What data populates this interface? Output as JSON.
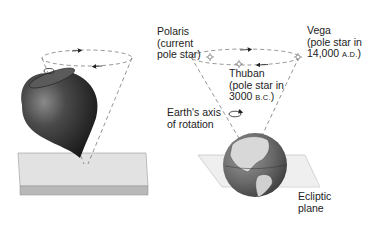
{
  "diagram": {
    "left_panel": {
      "objects": [
        "spinning-top",
        "tabletop-surface",
        "precession-cone"
      ]
    },
    "right_panel": {
      "labels": {
        "polaris_line1": "Polaris",
        "polaris_line2": "(current",
        "polaris_line3": "pole star)",
        "vega_line1": "Vega",
        "vega_line2": "(pole star in",
        "vega_line3_num": "14,000 ",
        "vega_line3_era": "A.D.",
        "vega_line3_close": ")",
        "thuban_line1": "Thuban",
        "thuban_line2": "(pole star in",
        "thuban_line3_num": "3000 ",
        "thuban_line3_era": "B.C.",
        "thuban_line3_close": ")",
        "axis_line1": "Earth's axis",
        "axis_line2": "of rotation",
        "ecliptic_line1": "Ecliptic",
        "ecliptic_line2": "plane"
      },
      "stars": [
        "Polaris",
        "Thuban",
        "Vega"
      ]
    },
    "colors": {
      "dashed_line": "#7a7a7a",
      "top_dark": "#2a2a2a",
      "table_top": "#e2e2e2",
      "table_edge": "#b8b8b8",
      "globe_land": "#d8d8d8",
      "globe_ocean": "#6a6a6a",
      "plane": "#ededed"
    }
  }
}
